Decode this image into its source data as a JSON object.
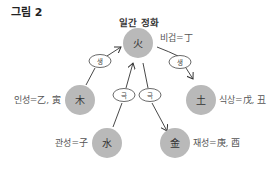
{
  "figure_label": "그림 2",
  "diagram_title": "일간 정화",
  "colors": {
    "node_fill": "#b9b9b9",
    "line": "#333333",
    "ellipse_fill": "#ffffff"
  },
  "nodes": [
    {
      "id": "fire",
      "glyph": "火",
      "side_label": "비겁=丁"
    },
    {
      "id": "wood",
      "glyph": "木",
      "side_label": "인성=乙, 寅"
    },
    {
      "id": "earth",
      "glyph": "土",
      "side_label": "식상=戊, 丑"
    },
    {
      "id": "water",
      "glyph": "水",
      "side_label": "관성=子"
    },
    {
      "id": "metal",
      "glyph": "金",
      "side_label": "재성=庚, 酉"
    }
  ],
  "relations": [
    {
      "from": "wood",
      "to": "fire",
      "label": "생"
    },
    {
      "from": "fire",
      "to": "earth",
      "label": "생"
    },
    {
      "from": "water",
      "to": "fire",
      "label": "극"
    },
    {
      "from": "fire",
      "to": "metal",
      "label": "극"
    }
  ]
}
